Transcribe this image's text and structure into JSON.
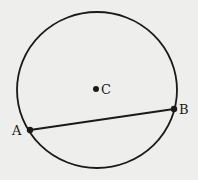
{
  "diagram": {
    "type": "geometry",
    "circle": {
      "cx": 97,
      "cy": 90,
      "rx": 80,
      "ry": 78,
      "stroke": "#1a1a1a"
    },
    "points": [
      {
        "id": "A",
        "label": "A",
        "x": 30,
        "y": 130,
        "label_x": 12,
        "label_y": 135
      },
      {
        "id": "B",
        "label": "B",
        "x": 174,
        "y": 109,
        "label_x": 179,
        "label_y": 114
      },
      {
        "id": "C",
        "label": "C",
        "x": 96,
        "y": 89,
        "label_x": 101,
        "label_y": 94
      }
    ],
    "segments": [
      {
        "from": "A",
        "to": "B"
      }
    ],
    "background": "#eeeeec"
  }
}
